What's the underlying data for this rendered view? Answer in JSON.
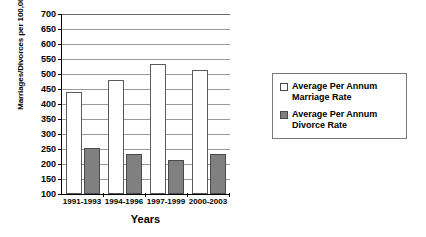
{
  "chart_data": {
    "type": "bar",
    "title": "",
    "xlabel": "Years",
    "ylabel": "Marriages/Divorces per 100,000",
    "categories": [
      "1991-1993",
      "1994-1996",
      "1997-1999",
      "2000-2003"
    ],
    "series": [
      {
        "name": "Average Per Annum Marriage Rate",
        "color": "#ffffff",
        "values": [
          440,
          480,
          535,
          515
        ]
      },
      {
        "name": "Average Per Annum Divorce Rate",
        "color": "#808080",
        "values": [
          255,
          233,
          213,
          232
        ]
      }
    ],
    "ylim": [
      100,
      700
    ],
    "ytick_step": 50,
    "yticks": [
      100,
      150,
      200,
      250,
      300,
      350,
      400,
      450,
      500,
      550,
      600,
      650,
      700
    ],
    "grid": true,
    "legend_position": "right"
  },
  "legend": {
    "items": [
      {
        "label": "Average Per Annum\nMarriage Rate",
        "swatch": "marriage"
      },
      {
        "label": "Average Per Annum\nDivorce Rate",
        "swatch": "divorce"
      }
    ]
  }
}
